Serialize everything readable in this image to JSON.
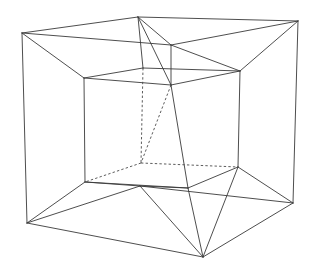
{
  "figure": {
    "name": "tesseract-schlegel-diagram",
    "type": "wireframe-projection",
    "title": "",
    "caption": "",
    "background_color": "#ffffff",
    "stroke_color": "#3a3a3a",
    "hidden_stroke_color": "#4a4a4a",
    "stroke_width": 0.9,
    "canvas": {
      "width": 317,
      "height": 275
    }
  },
  "geometry": {
    "outer_cube": {
      "label": "outer-cube",
      "vertices": {
        "back_top_left": [
          22,
          33
        ],
        "back_top_right": [
          138,
          17
        ],
        "front_top_right": [
          298,
          21
        ],
        "front_top_left": [
          170,
          45
        ],
        "back_bottom_left": [
          27,
          223
        ],
        "back_bottom_right": [
          140,
          186
        ],
        "front_bottom_right": [
          293,
          203
        ],
        "front_bottom_left": [
          203,
          257
        ]
      }
    },
    "inner_cube": {
      "label": "inner-cube",
      "vertices": {
        "back_top_left": [
          84,
          78
        ],
        "back_top_right": [
          143,
          68
        ],
        "front_top_right": [
          240,
          71
        ],
        "front_top_left": [
          171,
          85
        ],
        "back_bottom_left": [
          85,
          182
        ],
        "back_bottom_right": [
          141,
          163
        ],
        "front_bottom_right": [
          238,
          167
        ],
        "front_bottom_left": [
          188,
          188
        ]
      }
    },
    "solid_edges": [
      [
        [
          22,
          33
        ],
        [
          138,
          17
        ]
      ],
      [
        [
          138,
          17
        ],
        [
          298,
          21
        ]
      ],
      [
        [
          22,
          33
        ],
        [
          27,
          223
        ]
      ],
      [
        [
          298,
          21
        ],
        [
          293,
          203
        ]
      ],
      [
        [
          27,
          223
        ],
        [
          203,
          257
        ]
      ],
      [
        [
          203,
          257
        ],
        [
          293,
          203
        ]
      ],
      [
        [
          22,
          33
        ],
        [
          84,
          78
        ]
      ],
      [
        [
          138,
          17
        ],
        [
          143,
          68
        ]
      ],
      [
        [
          298,
          21
        ],
        [
          240,
          71
        ]
      ],
      [
        [
          27,
          223
        ],
        [
          85,
          182
        ]
      ],
      [
        [
          203,
          257
        ],
        [
          188,
          188
        ]
      ],
      [
        [
          293,
          203
        ],
        [
          238,
          167
        ]
      ],
      [
        [
          84,
          78
        ],
        [
          143,
          68
        ]
      ],
      [
        [
          143,
          68
        ],
        [
          240,
          71
        ]
      ],
      [
        [
          84,
          78
        ],
        [
          85,
          182
        ]
      ],
      [
        [
          240,
          71
        ],
        [
          238,
          167
        ]
      ],
      [
        [
          85,
          182
        ],
        [
          188,
          188
        ]
      ],
      [
        [
          188,
          188
        ],
        [
          238,
          167
        ]
      ],
      [
        [
          84,
          78
        ],
        [
          171,
          85
        ]
      ],
      [
        [
          240,
          71
        ],
        [
          171,
          85
        ]
      ],
      [
        [
          171,
          85
        ],
        [
          188,
          188
        ]
      ],
      [
        [
          138,
          17
        ],
        [
          171,
          45
        ]
      ],
      [
        [
          298,
          21
        ],
        [
          171,
          45
        ]
      ],
      [
        [
          22,
          33
        ],
        [
          171,
          45
        ]
      ],
      [
        [
          203,
          257
        ],
        [
          140,
          186
        ]
      ],
      [
        [
          293,
          203
        ],
        [
          140,
          186
        ]
      ],
      [
        [
          27,
          223
        ],
        [
          140,
          186
        ]
      ]
    ],
    "dashed_edges": [
      [
        [
          143,
          68
        ],
        [
          141,
          163
        ]
      ],
      [
        [
          141,
          163
        ],
        [
          85,
          182
        ]
      ],
      [
        [
          141,
          163
        ],
        [
          238,
          167
        ]
      ],
      [
        [
          171,
          85
        ],
        [
          141,
          163
        ]
      ]
    ]
  },
  "annotations": {
    "visible_text": [],
    "legend": [],
    "axis_labels": []
  }
}
